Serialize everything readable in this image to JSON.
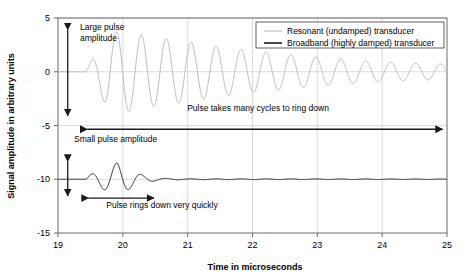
{
  "chart_data": {
    "type": "line",
    "title": "",
    "xlabel": "Time in microseconds",
    "ylabel": "Signal amplitude in arbitrary units",
    "xlim": [
      19,
      25
    ],
    "ylim": [
      -15,
      5
    ],
    "xticks": [
      "19",
      "20",
      "21",
      "22",
      "23",
      "24",
      "25"
    ],
    "yticks": [
      "5",
      "0",
      "-5",
      "-10",
      "-15"
    ],
    "xtick_values": [
      19,
      20,
      21,
      22,
      23,
      24,
      25
    ],
    "ytick_values": [
      5,
      0,
      -5,
      -10,
      -15
    ],
    "grid": "horizontal and vertical gridlines at ticks",
    "legend_position": "top-right inside axes",
    "series": [
      {
        "name": "Resonant (undamped) transducer",
        "color": "#b9b9b9",
        "baseline": 0,
        "center_freq_MHz": 2.6,
        "onset": 19.42,
        "peak_amplitude": 3.8,
        "decay_time_constant": 1.9,
        "tail_amplitude_at_25us": 0.7,
        "description": "Long ring-down: oscillates for many cycles across full 19-25 us window",
        "envelope_points": [
          {
            "t": 19.5,
            "a": 0.9
          },
          {
            "t": 19.8,
            "a": 3.6
          },
          {
            "t": 20.0,
            "a": 3.8
          },
          {
            "t": 20.4,
            "a": 3.3
          },
          {
            "t": 20.9,
            "a": 2.9
          },
          {
            "t": 21.4,
            "a": 2.4
          },
          {
            "t": 21.9,
            "a": 2.0
          },
          {
            "t": 22.4,
            "a": 1.7
          },
          {
            "t": 22.9,
            "a": 1.4
          },
          {
            "t": 23.4,
            "a": 1.15
          },
          {
            "t": 23.9,
            "a": 0.95
          },
          {
            "t": 24.4,
            "a": 0.82
          },
          {
            "t": 25.0,
            "a": 0.7
          }
        ]
      },
      {
        "name": "Broadband (highly damped) transducer",
        "color": "#1a1a1a",
        "baseline": -10,
        "center_freq_MHz": 2.6,
        "onset": 19.42,
        "peak_amplitude": 1.55,
        "decay_time_constant": 0.2,
        "tail_amplitude_at_25us": 0.02,
        "description": "Short ring-down: about three cycles then flat baseline",
        "envelope_points": [
          {
            "t": 19.5,
            "a": 0.45
          },
          {
            "t": 19.72,
            "a": 1.0
          },
          {
            "t": 19.92,
            "a": 1.55
          },
          {
            "t": 20.12,
            "a": 0.85
          },
          {
            "t": 20.32,
            "a": 0.35
          },
          {
            "t": 20.55,
            "a": 0.1
          },
          {
            "t": 20.9,
            "a": 0.04
          },
          {
            "t": 25.0,
            "a": 0.02
          }
        ]
      }
    ],
    "annotations": [
      {
        "id": "large-pulse-amplitude",
        "text": "Large pulse amplitude",
        "kind": "double-arrow-vertical",
        "x": 19.15,
        "y_from": 3.9,
        "y_to": -4.1
      },
      {
        "id": "pulse-takes-many-cycles",
        "text": "Pulse takes many cycles to ring down",
        "kind": "double-arrow-horizontal",
        "y": -5.35,
        "x_from": 19.45,
        "x_to": 24.93
      },
      {
        "id": "small-pulse-amplitude",
        "text": "Small pulse amplitude",
        "kind": "double-arrow-vertical",
        "x": 19.15,
        "y_from": -8.35,
        "y_to": -11.55
      },
      {
        "id": "pulse-rings-down-quickly",
        "text": "Pulse rings down very quickly",
        "kind": "double-arrow-horizontal",
        "y": -11.75,
        "x_from": 19.47,
        "x_to": 20.48
      }
    ]
  },
  "annotation_labels": {
    "large_pulse_line1": "Large pulse",
    "large_pulse_line2": "amplitude",
    "many_cycles": "Pulse takes many cycles to ring down",
    "small_pulse": "Small pulse amplitude",
    "rings_down": "Pulse rings down very quickly"
  },
  "axes": {
    "x_title": "Time in microseconds",
    "y_title": "Signal amplitude in arbitrary units"
  },
  "legend": {
    "items": [
      {
        "label": "Resonant (undamped) transducer",
        "color": "#b9b9b9"
      },
      {
        "label": "Broadband (highly damped) transducer",
        "color": "#1a1a1a"
      }
    ]
  },
  "colors": {
    "resonant": "#b9b9b9",
    "broadband": "#1a1a1a",
    "grid": "#cccccc",
    "axis": "#6b6b6b",
    "background": "#ffffff"
  }
}
